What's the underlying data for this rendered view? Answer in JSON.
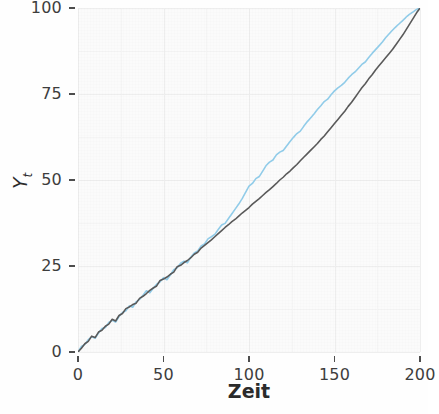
{
  "chart_data": {
    "type": "line",
    "title": "",
    "subtitle": "",
    "xlabel": "Zeit",
    "ylabel": "Y_t",
    "ylabel_base": "Y",
    "ylabel_sub": "t",
    "xlim": [
      0,
      200
    ],
    "ylim": [
      0,
      100
    ],
    "xticks": [
      0,
      50,
      100,
      150,
      200
    ],
    "yticks": [
      0,
      25,
      50,
      75,
      100
    ],
    "xtick_labels": [
      "0",
      "50",
      "100",
      "150",
      "200"
    ],
    "ytick_labels": [
      "0",
      "25",
      "50",
      "75",
      "100"
    ],
    "grid": true,
    "grid_major": true,
    "grid_minor": true,
    "legend": "none",
    "panel_background": "#fbfbfb",
    "grid_color": "#eeeeee",
    "axis_text_color": "#3d3d3d",
    "series": [
      {
        "name": "series-blue",
        "color": "#92cdea",
        "width": 1.6,
        "x": [
          0,
          2,
          4,
          6,
          8,
          10,
          12,
          14,
          16,
          18,
          20,
          22,
          24,
          26,
          28,
          30,
          32,
          34,
          36,
          38,
          40,
          42,
          44,
          46,
          48,
          50,
          52,
          54,
          56,
          58,
          60,
          62,
          64,
          66,
          68,
          70,
          72,
          74,
          76,
          78,
          80,
          82,
          84,
          86,
          88,
          90,
          92,
          94,
          96,
          98,
          100,
          102,
          104,
          106,
          108,
          110,
          112,
          114,
          116,
          118,
          120,
          122,
          124,
          126,
          128,
          130,
          132,
          134,
          136,
          138,
          140,
          142,
          144,
          146,
          148,
          150,
          152,
          154,
          156,
          158,
          160,
          162,
          164,
          166,
          168,
          170,
          172,
          174,
          176,
          178,
          180,
          182,
          184,
          186,
          188,
          190,
          192,
          194,
          196,
          198,
          200
        ],
        "values": [
          0.0,
          1.6,
          2.2,
          3.6,
          4.4,
          4.0,
          5.5,
          6.8,
          7.1,
          8.6,
          9.2,
          8.7,
          10.3,
          11.5,
          12.0,
          13.4,
          13.0,
          14.6,
          15.3,
          16.5,
          17.8,
          17.2,
          18.5,
          19.7,
          20.4,
          21.6,
          21.0,
          22.4,
          23.9,
          24.5,
          25.8,
          26.4,
          25.9,
          27.6,
          28.8,
          29.4,
          30.8,
          31.4,
          32.9,
          33.5,
          34.2,
          35.6,
          36.9,
          37.4,
          38.8,
          40.2,
          41.6,
          43.0,
          44.6,
          46.4,
          48.2,
          49.0,
          50.4,
          51.0,
          52.6,
          54.2,
          55.2,
          55.8,
          57.3,
          58.1,
          58.6,
          59.9,
          61.2,
          62.4,
          63.5,
          64.2,
          65.6,
          66.9,
          68.0,
          69.2,
          70.5,
          71.6,
          72.8,
          73.5,
          74.8,
          75.9,
          76.8,
          77.5,
          78.4,
          79.6,
          80.6,
          81.4,
          82.5,
          83.6,
          84.3,
          85.6,
          86.8,
          87.9,
          89.0,
          90.1,
          91.4,
          92.5,
          93.6,
          94.6,
          95.5,
          96.4,
          97.4,
          98.2,
          98.9,
          99.6,
          100.0
        ]
      },
      {
        "name": "series-dark",
        "color": "#5a5a5a",
        "width": 1.6,
        "x": [
          0,
          2,
          4,
          6,
          8,
          10,
          12,
          14,
          16,
          18,
          20,
          22,
          24,
          26,
          28,
          30,
          32,
          34,
          36,
          38,
          40,
          42,
          44,
          46,
          48,
          50,
          52,
          54,
          56,
          58,
          60,
          62,
          64,
          66,
          68,
          70,
          72,
          74,
          76,
          78,
          80,
          82,
          84,
          86,
          88,
          90,
          92,
          94,
          96,
          98,
          100,
          102,
          104,
          106,
          108,
          110,
          112,
          114,
          116,
          118,
          120,
          122,
          124,
          126,
          128,
          130,
          132,
          134,
          136,
          138,
          140,
          142,
          144,
          146,
          148,
          150,
          152,
          154,
          156,
          158,
          160,
          162,
          164,
          166,
          168,
          170,
          172,
          174,
          176,
          178,
          180,
          182,
          184,
          186,
          188,
          190,
          192,
          194,
          196,
          198,
          200
        ],
        "values": [
          0.0,
          1.1,
          2.4,
          3.1,
          4.6,
          4.2,
          5.8,
          6.3,
          7.5,
          8.1,
          9.5,
          9.0,
          10.6,
          11.2,
          12.6,
          13.1,
          13.8,
          14.2,
          15.6,
          16.2,
          17.0,
          17.9,
          18.6,
          19.2,
          20.8,
          21.2,
          21.8,
          22.6,
          23.2,
          24.8,
          25.2,
          26.0,
          26.6,
          27.4,
          28.4,
          29.0,
          30.2,
          31.0,
          31.8,
          32.6,
          33.5,
          34.4,
          35.3,
          36.2,
          37.0,
          37.9,
          38.6,
          39.5,
          40.4,
          41.2,
          42.0,
          43.0,
          43.8,
          44.6,
          45.5,
          46.4,
          47.2,
          48.1,
          49.0,
          50.0,
          50.8,
          51.8,
          52.6,
          53.6,
          54.5,
          55.6,
          56.6,
          57.6,
          58.6,
          59.6,
          60.6,
          61.8,
          62.8,
          64.0,
          65.2,
          66.4,
          67.6,
          68.8,
          70.0,
          71.4,
          72.6,
          74.0,
          75.4,
          76.8,
          78.0,
          79.4,
          80.6,
          82.0,
          83.2,
          84.4,
          85.6,
          86.8,
          88.0,
          89.4,
          90.8,
          92.2,
          93.8,
          95.4,
          97.0,
          98.6,
          100.0
        ]
      }
    ]
  }
}
